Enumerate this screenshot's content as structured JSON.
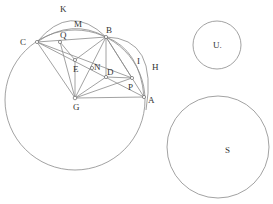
{
  "diagram": {
    "labels": {
      "K": "K",
      "M": "M",
      "B": "B",
      "C": "C",
      "Q": "Q",
      "E": "E",
      "N": "N",
      "D": "D",
      "I": "I",
      "H": "H",
      "P": "P",
      "G": "G",
      "A": "A",
      "U": "U.",
      "S": "S"
    },
    "points": {
      "C": [
        37,
        42
      ],
      "Q": [
        60,
        42
      ],
      "B": [
        106,
        37
      ],
      "E": [
        75,
        60
      ],
      "N": [
        92,
        68
      ],
      "D": [
        106,
        77
      ],
      "P": [
        132,
        78
      ],
      "G": [
        75,
        98
      ],
      "A": [
        144,
        97
      ]
    },
    "circles": {
      "main": {
        "cx": 75,
        "cy": 100,
        "r": 70
      },
      "U": {
        "cx": 217,
        "cy": 45,
        "r": 24
      },
      "S": {
        "cx": 218,
        "cy": 147,
        "r": 51
      }
    }
  }
}
